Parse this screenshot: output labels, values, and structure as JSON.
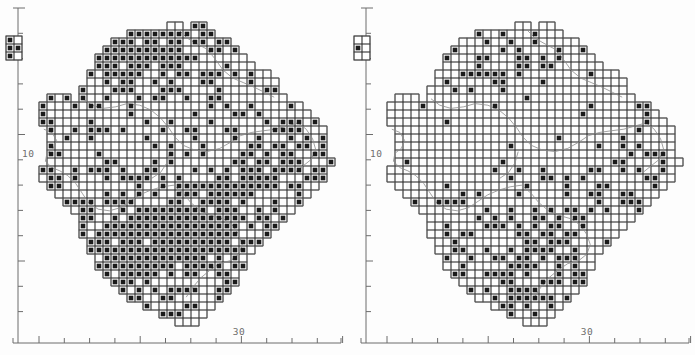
{
  "figure": {
    "type": "distribution-atlas-map-pair",
    "background_color": "#fdfdfd",
    "ink_color": "#1a1a1a",
    "grid_color": "#3a3a3a",
    "outline_color": "#8a8a8a",
    "axis_color": "#6d6d6d",
    "width": 695,
    "height": 355,
    "panel_count": 2
  },
  "panels": [
    {
      "id": "left",
      "name": "left-map-panel",
      "x_axis": {
        "name": "x-axis",
        "labels": [
          "30"
        ],
        "label_positions": [
          239
        ],
        "tick_count": 13,
        "tick_first_x": 39,
        "tick_spacing": 25.3,
        "axis_y": 343,
        "axis_x_start": 13,
        "axis_x_end": 341
      },
      "y_axis": {
        "name": "y-axis",
        "labels": [
          "10"
        ],
        "label_positions": [
          157
        ],
        "tick_count": 13,
        "tick_first_y": 8,
        "tick_spacing": 25.3,
        "axis_x": 18,
        "axis_y_start": 8,
        "axis_y_end": 343
      },
      "inset": {
        "name": "inset-outlier-box",
        "x": 6,
        "y": 36,
        "cols": 2,
        "rows": 3,
        "cell": 8,
        "filled": [
          [
            0,
            0
          ],
          [
            0,
            1
          ],
          [
            1,
            1
          ],
          [
            0,
            2
          ]
        ]
      },
      "density": "high",
      "filled_cell_count": 612
    },
    {
      "id": "right",
      "name": "right-map-panel",
      "x_axis": {
        "name": "x-axis",
        "labels": [
          "30"
        ],
        "label_positions": [
          239
        ],
        "tick_count": 13,
        "tick_first_x": 39,
        "tick_spacing": 25.3,
        "axis_y": 343,
        "axis_x_start": 13,
        "axis_x_end": 341
      },
      "y_axis": {
        "name": "y-axis",
        "labels": [
          "10"
        ],
        "label_positions": [
          157
        ],
        "tick_count": 13,
        "tick_first_y": 8,
        "tick_spacing": 25.3,
        "axis_x": 18,
        "axis_y_start": 8,
        "axis_y_end": 343
      },
      "inset": {
        "name": "inset-outlier-box",
        "x": 6,
        "y": 36,
        "cols": 2,
        "rows": 3,
        "cell": 8,
        "filled": [
          [
            0,
            1
          ]
        ]
      },
      "density": "low",
      "filled_cell_count": 268
    }
  ],
  "chart_data": {
    "type": "scatter",
    "title": "",
    "subtitle": "",
    "xlabel": "",
    "ylabel": "",
    "grid": true,
    "legend": null,
    "xlim": [
      0,
      13
    ],
    "ylim": [
      0,
      13
    ],
    "xticks": [
      "",
      "",
      "",
      "",
      "",
      "",
      "",
      "",
      "30",
      "",
      "",
      "",
      ""
    ],
    "yticks": [
      "",
      "",
      "",
      "",
      "",
      "10",
      "",
      "",
      "",
      "",
      "",
      "",
      ""
    ],
    "x_tick_labels_shown": [
      "30"
    ],
    "y_tick_labels_shown": [
      "10"
    ],
    "note": "Pair of UK-style 10km-square distribution atlas maps; filled squares denote presence records. Left panel dense, right panel sparse.",
    "series": [
      {
        "name": "left-panel-presence",
        "count": 612,
        "marker": "filled-square"
      },
      {
        "name": "right-panel-presence",
        "count": 268,
        "marker": "filled-square"
      }
    ]
  }
}
